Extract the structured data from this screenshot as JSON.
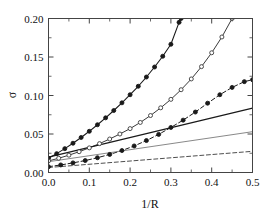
{
  "chart_data": {
    "type": "line",
    "title": "",
    "xlabel": "1/R",
    "ylabel": "σ",
    "xlim": [
      0.0,
      0.5
    ],
    "ylim": [
      0.0,
      0.2
    ],
    "xticks": [
      0.0,
      0.1,
      0.2,
      0.3,
      0.4,
      0.5
    ],
    "xtick_labels": [
      "0.0",
      "0.1",
      "0.2",
      "0.3",
      "0.4",
      "0.5"
    ],
    "xticks_minor": [
      0.05,
      0.15,
      0.25,
      0.35,
      0.45
    ],
    "yticks": [
      0.0,
      0.05,
      0.1,
      0.15,
      0.2
    ],
    "ytick_labels": [
      "0.00",
      "0.05",
      "0.10",
      "0.15",
      "0.20"
    ],
    "yticks_minor": [
      0.025,
      0.075,
      0.125,
      0.175
    ],
    "grid": false,
    "legend": "none",
    "series": [
      {
        "name": "curve-1-steep-filled-circles",
        "style": "solid",
        "marker": "filled-circle",
        "color": "#1a1a1a",
        "linewidth": 1.1,
        "x": [
          0.0,
          0.02,
          0.04,
          0.06,
          0.08,
          0.1,
          0.12,
          0.14,
          0.16,
          0.18,
          0.2,
          0.22,
          0.24,
          0.26,
          0.28,
          0.3,
          0.32,
          0.325
        ],
        "y": [
          0.0185,
          0.0245,
          0.031,
          0.038,
          0.0455,
          0.0535,
          0.062,
          0.071,
          0.0805,
          0.0905,
          0.101,
          0.112,
          0.124,
          0.137,
          0.151,
          0.1665,
          0.195,
          0.2
        ]
      },
      {
        "name": "curve-2-open-circles",
        "style": "solid",
        "marker": "open-circle",
        "color": "#3a3a3a",
        "linewidth": 1.0,
        "x": [
          0.0,
          0.025,
          0.05,
          0.075,
          0.1,
          0.125,
          0.15,
          0.175,
          0.2,
          0.225,
          0.25,
          0.275,
          0.3,
          0.325,
          0.35,
          0.375,
          0.4,
          0.425,
          0.45
        ],
        "y": [
          0.015,
          0.0185,
          0.0225,
          0.027,
          0.032,
          0.0375,
          0.0435,
          0.05,
          0.057,
          0.065,
          0.074,
          0.084,
          0.095,
          0.1075,
          0.1215,
          0.1375,
          0.1555,
          0.176,
          0.2
        ]
      },
      {
        "name": "curve-3-dashed-filled-circles",
        "style": "dashed",
        "marker": "filled-circle",
        "color": "#1a1a1a",
        "linewidth": 1.0,
        "x": [
          0.0,
          0.03,
          0.06,
          0.09,
          0.12,
          0.15,
          0.18,
          0.21,
          0.24,
          0.27,
          0.3,
          0.33,
          0.36,
          0.39,
          0.42,
          0.45,
          0.48,
          0.5
        ],
        "y": [
          0.0075,
          0.0098,
          0.0125,
          0.0155,
          0.0192,
          0.0235,
          0.0285,
          0.0345,
          0.0415,
          0.0495,
          0.0585,
          0.068,
          0.0785,
          0.09,
          0.101,
          0.1105,
          0.118,
          0.1205
        ]
      },
      {
        "name": "curve-4-solid-thick-line",
        "style": "solid",
        "marker": "none",
        "color": "#1a1a1a",
        "linewidth": 1.2,
        "x": [
          0.0,
          0.5
        ],
        "y": [
          0.02,
          0.0835
        ]
      },
      {
        "name": "curve-5-solid-thin-line",
        "style": "solid",
        "marker": "none",
        "color": "#6a6a6a",
        "linewidth": 0.8,
        "x": [
          0.0,
          0.5
        ],
        "y": [
          0.014,
          0.053
        ]
      },
      {
        "name": "curve-6-dashed-line",
        "style": "dashed",
        "marker": "none",
        "color": "#3a3a3a",
        "linewidth": 0.9,
        "x": [
          0.0,
          0.5
        ],
        "y": [
          0.0065,
          0.0275
        ]
      }
    ]
  }
}
